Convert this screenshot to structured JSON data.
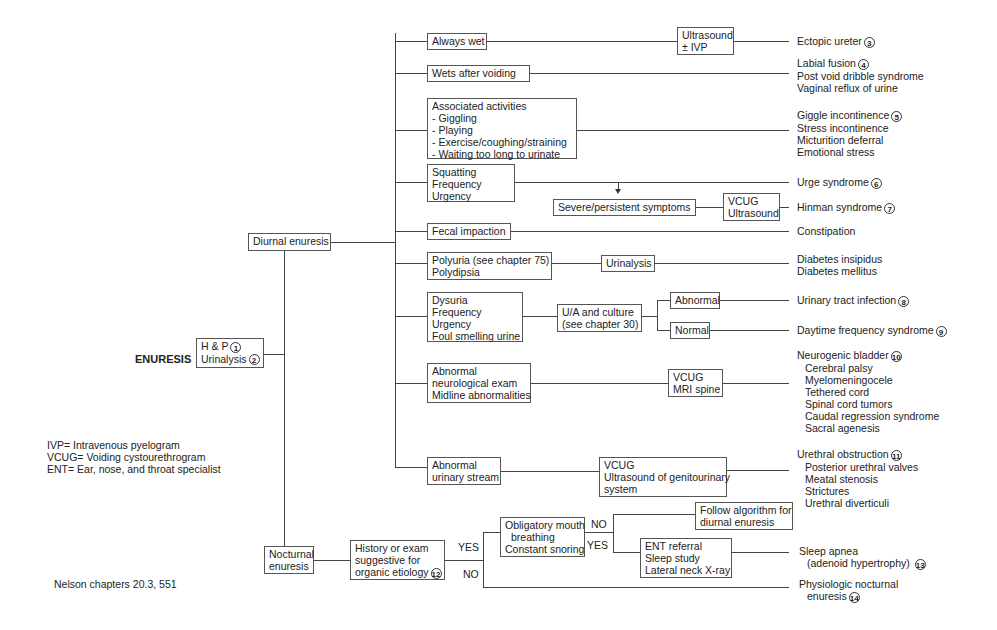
{
  "title": "ENURESIS",
  "root": {
    "line1": "H & P",
    "num1": "1",
    "line2": "Urinalysis",
    "num2": "2"
  },
  "diurnal": {
    "label": "Diurnal enuresis"
  },
  "nocturnal": {
    "label": "Nocturnal enuresis",
    "line1": "Nocturnal",
    "line2": "enuresis"
  },
  "branches": {
    "always_wet": {
      "label": "Always wet",
      "test": [
        "Ultrasound",
        "± IVP"
      ],
      "outcome": "Ectopic ureter",
      "num": "3"
    },
    "wets_after": {
      "label": "Wets after voiding",
      "outcomes": [
        "Labial fusion",
        "Post void dribble syndrome",
        "Vaginal reflux of urine"
      ],
      "num": "4"
    },
    "activities": {
      "label": [
        "Associated activities",
        "- Giggling",
        "- Playing",
        "- Exercise/coughing/straining",
        "- Waiting too long to urinate"
      ],
      "outcomes": [
        "Giggle incontinence",
        "Stress incontinence",
        "Micturition deferral",
        "Emotional stress"
      ],
      "num": "5"
    },
    "squatting": {
      "label": [
        "Squatting",
        "Frequency",
        "Urgency"
      ],
      "outcome": "Urge syndrome",
      "num": "6",
      "severe": "Severe/persistent symptoms",
      "test": [
        "VCUG",
        "Ultrasound"
      ],
      "outcome2": "Hinman syndrome",
      "num2": "7"
    },
    "fecal": {
      "label": "Fecal impaction",
      "outcome": "Constipation"
    },
    "polyuria": {
      "label": [
        "Polyuria (see chapter 75)",
        "Polydipsia"
      ],
      "test": "Urinalysis",
      "outcomes": [
        "Diabetes insipidus",
        "Diabetes mellitus"
      ]
    },
    "dysuria": {
      "label": [
        "Dysuria",
        "Frequency",
        "Urgency",
        "Foul smelling urine"
      ],
      "test": [
        "U/A and culture",
        "(see chapter 30)"
      ],
      "abnormal": "Abnormal",
      "normal": "Normal",
      "outcome_abn": "Urinary tract infection",
      "num_abn": "8",
      "outcome_norm": "Daytime frequency syndrome",
      "num_norm": "9"
    },
    "neuro": {
      "label": [
        "Abnormal",
        "neurological exam",
        "Midline abnormalities"
      ],
      "test": [
        "VCUG",
        "MRI spine"
      ],
      "outcome_head": "Neurogenic bladder",
      "num": "10",
      "outcomes": [
        "Cerebral palsy",
        "Myelomeningocele",
        "Tethered cord",
        "Spinal cord tumors",
        "Caudal regression syndrome",
        "Sacral agenesis"
      ]
    },
    "stream": {
      "label": [
        "Abnormal",
        "urinary stream"
      ],
      "test": [
        "VCUG",
        "Ultrasound of genitourinary",
        "system"
      ],
      "outcome_head": "Urethral obstruction",
      "num": "11",
      "outcomes": [
        "Posterior urethral valves",
        "Meatal stenosis",
        "Strictures",
        "Urethral diverticuli"
      ]
    }
  },
  "nocturnal_path": {
    "history": [
      "History or exam",
      "suggestive for",
      "organic etiology"
    ],
    "num": "12",
    "yes": "YES",
    "no": "NO",
    "obligatory": [
      "Obligatory mouth",
      "breathing",
      "Constant snoring"
    ],
    "no2": "NO",
    "yes2": "YES",
    "follow": [
      "Follow algorithm for",
      "diurnal enuresis"
    ],
    "ent": [
      "ENT referral",
      "Sleep study",
      "Lateral neck X-ray"
    ],
    "sleep_apnea": [
      "Sleep apnea",
      "(adenoid hypertrophy)"
    ],
    "num13": "13",
    "physiologic": [
      "Physiologic nocturnal",
      "enuresis"
    ],
    "num14": "14"
  },
  "legend": [
    "IVP= Intravenous pyelogram",
    "VCUG= Voiding cystourethrogram",
    "ENT= Ear, nose, and throat specialist"
  ],
  "reference": "Nelson chapters 20.3, 551"
}
